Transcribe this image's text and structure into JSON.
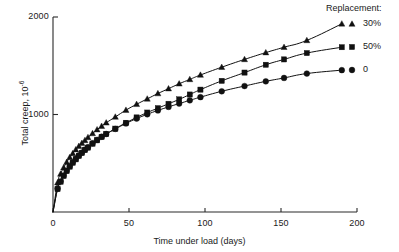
{
  "chart_data": {
    "type": "line",
    "title": "",
    "xlabel": "Time under load (days)",
    "ylabel": "Total creep, 10",
    "ylabel_exponent": "-6",
    "xlim": [
      0,
      200
    ],
    "ylim": [
      0,
      2000
    ],
    "xticks": [
      0,
      50,
      100,
      150,
      200
    ],
    "xticklabels": [
      "0",
      "50",
      "100",
      "150",
      "200"
    ],
    "yticks": [
      1000,
      2000
    ],
    "yticklabels": [
      "1000",
      "2000"
    ],
    "grid": false,
    "legend_title": "Replacement:",
    "legend_position": "right-outside",
    "series": [
      {
        "name": "30%",
        "marker": "triangle",
        "color": "#111111",
        "x": [
          0,
          3,
          5,
          7,
          9,
          11,
          13,
          15,
          17,
          19,
          21,
          23,
          26,
          29,
          32,
          35,
          41,
          48,
          55,
          62,
          69,
          76,
          83,
          90,
          97,
          111,
          126,
          140,
          152,
          167,
          190
        ],
        "y": [
          0,
          300,
          390,
          455,
          510,
          560,
          600,
          640,
          675,
          705,
          735,
          765,
          805,
          845,
          880,
          915,
          975,
          1045,
          1105,
          1160,
          1215,
          1265,
          1315,
          1360,
          1405,
          1485,
          1565,
          1635,
          1690,
          1760,
          1930
        ]
      },
      {
        "name": "50%",
        "marker": "square",
        "color": "#111111",
        "x": [
          0,
          3,
          5,
          7,
          9,
          11,
          13,
          15,
          17,
          19,
          21,
          23,
          26,
          29,
          32,
          35,
          41,
          48,
          55,
          62,
          69,
          76,
          83,
          90,
          97,
          111,
          126,
          140,
          152,
          167,
          190
        ],
        "y": [
          0,
          235,
          310,
          370,
          420,
          465,
          505,
          540,
          575,
          605,
          635,
          660,
          700,
          735,
          770,
          800,
          855,
          915,
          970,
          1020,
          1065,
          1110,
          1155,
          1205,
          1255,
          1345,
          1430,
          1510,
          1565,
          1630,
          1690
        ]
      },
      {
        "name": "0",
        "marker": "circle",
        "color": "#111111",
        "x": [
          0,
          3,
          5,
          7,
          9,
          11,
          13,
          15,
          17,
          19,
          21,
          23,
          26,
          29,
          32,
          35,
          41,
          48,
          55,
          62,
          69,
          76,
          83,
          90,
          97,
          111,
          126,
          140,
          152,
          167,
          190
        ],
        "y": [
          0,
          240,
          315,
          375,
          425,
          470,
          510,
          545,
          580,
          610,
          640,
          665,
          705,
          740,
          772,
          800,
          852,
          908,
          958,
          1002,
          1042,
          1078,
          1112,
          1145,
          1178,
          1238,
          1292,
          1340,
          1375,
          1420,
          1455
        ]
      }
    ]
  }
}
